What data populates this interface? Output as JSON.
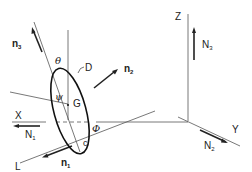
{
  "diagram": {
    "type": "rolling-disk-coordinate-diagram",
    "labels": {
      "n3": "n",
      "n3_sub": "3",
      "n2": "n",
      "n2_sub": "2",
      "n1": "n",
      "n1_sub": "1",
      "theta": "θ",
      "psi": "ψ",
      "phi": "Φ",
      "D": "D",
      "G": "G",
      "c": "c",
      "X": "X",
      "Y": "Y",
      "Z": "Z",
      "L": "L",
      "N1": "N",
      "N1_sub": "1",
      "N2": "N",
      "N2_sub": "2",
      "N3": "N",
      "N3_sub": "3"
    },
    "colors": {
      "line": "#444444",
      "arrow": "#222222",
      "disk": "#111111"
    }
  }
}
